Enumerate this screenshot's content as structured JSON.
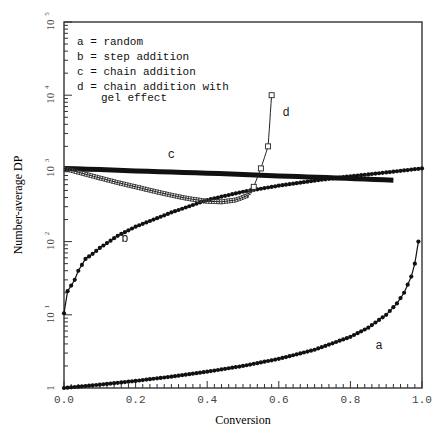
{
  "chart_data": {
    "type": "line",
    "title": "",
    "xlabel": "Conversion",
    "ylabel": "Number-average DP",
    "xlim": [
      0.0,
      1.0
    ],
    "ylim": [
      1,
      100000
    ],
    "yscale": "log",
    "grid": false,
    "x_ticks": [
      "0.0",
      "0.2",
      "0.4",
      "0.6",
      "0.8",
      "1.0"
    ],
    "y_ticks": [
      {
        "value": 1,
        "label": "1"
      },
      {
        "value": 10,
        "label": "10^1"
      },
      {
        "value": 100,
        "label": "10^2"
      },
      {
        "value": 1000,
        "label": "10^3"
      },
      {
        "value": 10000,
        "label": "10^4"
      },
      {
        "value": 100000,
        "label": "10^5"
      }
    ],
    "legend": {
      "position": "upper-left",
      "entries": [
        {
          "key": "a",
          "text": "a = random"
        },
        {
          "key": "b",
          "text": "b = step addition"
        },
        {
          "key": "c",
          "text": "c = chain addition"
        },
        {
          "key": "d",
          "text": "d = chain addition with",
          "text2": "gel effect"
        }
      ]
    },
    "series": [
      {
        "name": "a",
        "label": "random",
        "marker": "dot",
        "x": [
          0.0,
          0.1,
          0.2,
          0.3,
          0.4,
          0.5,
          0.6,
          0.7,
          0.8,
          0.85,
          0.9,
          0.93,
          0.95,
          0.97,
          0.98,
          0.99
        ],
        "y": [
          1.0,
          1.11,
          1.25,
          1.43,
          1.67,
          2.0,
          2.5,
          3.33,
          5.0,
          6.67,
          10.0,
          14.3,
          20.0,
          33.3,
          50.0,
          100.0
        ],
        "annotation": {
          "text": "a",
          "x": 0.87,
          "y": 3.4
        }
      },
      {
        "name": "b",
        "label": "step addition",
        "marker": "dot",
        "x": [
          0.0,
          0.01,
          0.03,
          0.04,
          0.05,
          0.06,
          0.08,
          0.1,
          0.15,
          0.2,
          0.3,
          0.4,
          0.5,
          0.6,
          0.7,
          0.76,
          0.8,
          0.9,
          1.0
        ],
        "y": [
          10.5,
          21,
          30,
          40,
          48,
          58,
          68,
          82,
          120,
          160,
          250,
          370,
          480,
          580,
          680,
          740,
          780,
          880,
          1000
        ],
        "annotation": {
          "text": "b",
          "x": 0.16,
          "y": 100
        }
      },
      {
        "name": "c",
        "label": "chain addition",
        "marker": "none",
        "x": [
          0.0,
          0.2,
          0.4,
          0.6,
          0.76,
          0.92
        ],
        "y": [
          1000,
          925,
          860,
          790,
          740,
          690
        ],
        "annotation": {
          "text": "c",
          "x": 0.29,
          "y": 1400
        }
      },
      {
        "name": "d",
        "label": "chain addition with gel effect",
        "marker": "square",
        "x": [
          0.0,
          0.05,
          0.1,
          0.15,
          0.2,
          0.25,
          0.3,
          0.35,
          0.4,
          0.44,
          0.48,
          0.51,
          0.53,
          0.55,
          0.57,
          0.58
        ],
        "y": [
          1000,
          860,
          740,
          640,
          560,
          490,
          430,
          385,
          355,
          350,
          370,
          420,
          560,
          1000,
          2000,
          10000
        ],
        "annotation": {
          "text": "d",
          "x": 0.61,
          "y": 5200
        }
      }
    ]
  }
}
